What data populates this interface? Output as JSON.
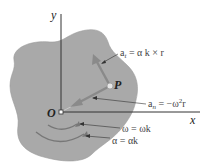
{
  "figure": {
    "axes": {
      "x_label": "x",
      "y_label": "y",
      "origin_label": "O"
    },
    "point_label": "P",
    "labels": {
      "tangential_accel": "a_t = α k × r",
      "tangential_accel_main": "a",
      "tangential_accel_sub": "t",
      "tangential_accel_rhs": " = α k × r",
      "normal_accel_main": "a",
      "normal_accel_sub": "n",
      "normal_accel_rhs": " = −ω",
      "normal_accel_sup": "2",
      "normal_accel_tail": "r",
      "angular_velocity": "ω = ωk",
      "angular_accel": "α = αk"
    },
    "colors": {
      "body_fill": "#a9a9a9",
      "vector_color": "#888888",
      "axis_color": "#333333",
      "arc_color": "#7a7a7a",
      "background": "#ffffff"
    }
  }
}
